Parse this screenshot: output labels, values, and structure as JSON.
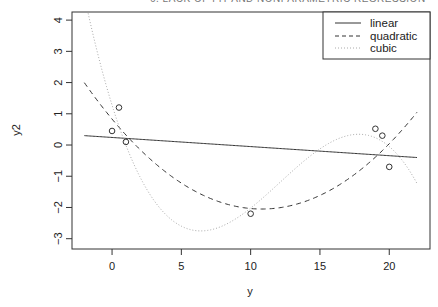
{
  "page_header": "6. LACK OF FIT AND NONPARAMETRIC REGRESSION",
  "chart_data": {
    "type": "scatter",
    "title": "",
    "xlabel": "y",
    "ylabel": "y2",
    "xlim": [
      -2.89,
      22.94
    ],
    "ylim": [
      -3.33,
      4.26
    ],
    "grid": false,
    "legend_position": "top-right",
    "x_ticks": [
      0,
      5,
      10,
      15,
      20
    ],
    "y_ticks": [
      -3,
      -2,
      -1,
      0,
      1,
      2,
      3,
      4
    ],
    "points": {
      "x": [
        0,
        0.5,
        1,
        10,
        19,
        19.5,
        20
      ],
      "y": [
        0.45,
        1.2,
        0.1,
        -2.2,
        0.52,
        0.3,
        -0.7
      ],
      "marker": "open-circle"
    },
    "series": [
      {
        "name": "linear",
        "style": "solid",
        "domain": [
          -2,
          22
        ],
        "coefficients": [
          0.242,
          -0.0292,
          0,
          0
        ]
      },
      {
        "name": "quadratic",
        "style": "dashed",
        "domain": [
          -2,
          22
        ],
        "coefficients": [
          0.831,
          -0.5335,
          0.0247,
          0
        ]
      },
      {
        "name": "cubic",
        "style": "dotted",
        "domain": [
          -2,
          22
        ],
        "coefficients": [
          1.278,
          -1.4303,
          0.1519,
          -0.004185
        ]
      }
    ],
    "legend": [
      "linear",
      "quadratic",
      "cubic"
    ],
    "colors": {
      "axis": "#333333",
      "linear": "#333333",
      "quadratic": "#333333",
      "cubic": "#aaaaaa",
      "points": "#333333"
    }
  }
}
